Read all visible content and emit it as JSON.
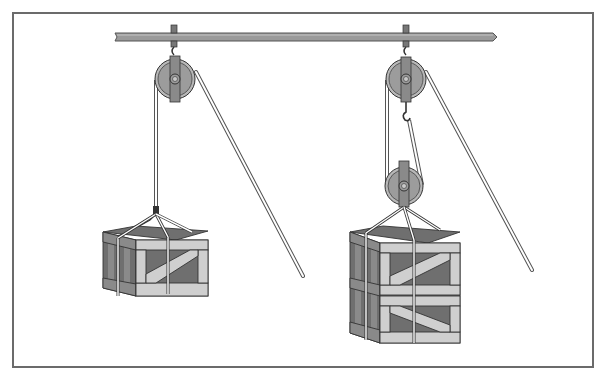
{
  "diagram": {
    "title": "Pulley systems: single fixed pulley vs. fixed and movable pulley",
    "frame": {
      "border_color": "#6b6b6b"
    },
    "colors": {
      "beam": "#9a9a9a",
      "beam_outline": "#555555",
      "pulley_wheel": "#9c9c9c",
      "pulley_groove": "#b8b8b8",
      "pulley_strap": "#8a8a8a",
      "rope": "#ffffff",
      "rope_outline": "#555555",
      "crate_dark": "#6f6f6f",
      "crate_mid": "#8a8a8a",
      "crate_light": "#cfcfcf",
      "outline": "#333333"
    },
    "systems": [
      {
        "id": "left",
        "label": "Single fixed pulley",
        "pulleys": [
          "fixed"
        ],
        "load": "single crate"
      },
      {
        "id": "right",
        "label": "Fixed pulley with movable pulley",
        "pulleys": [
          "fixed",
          "movable"
        ],
        "load": "two stacked crates"
      }
    ]
  }
}
